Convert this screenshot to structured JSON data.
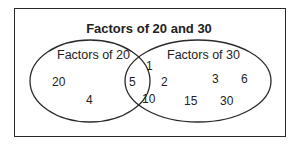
{
  "title": "Factors of 20 and 30",
  "sets": [
    {
      "label": "Factors of 20",
      "only": [
        "20",
        "4"
      ]
    },
    {
      "label": "Factors of 30",
      "only": [
        "3",
        "6",
        "15",
        "30"
      ]
    }
  ],
  "intersection": [
    "1",
    "5",
    "2",
    "10"
  ],
  "colors": {
    "stroke": "#2a2a2a",
    "text": "#222222",
    "background": "#ffffff"
  }
}
